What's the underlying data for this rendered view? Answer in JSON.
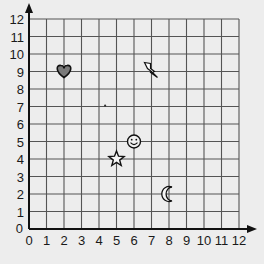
{
  "chart_data": {
    "type": "scatter",
    "title": "",
    "xlabel": "",
    "ylabel": "",
    "xlim": [
      0,
      12
    ],
    "ylim": [
      0,
      12
    ],
    "grid": true,
    "x_ticks": [
      "0",
      "1",
      "2",
      "3",
      "4",
      "5",
      "6",
      "7",
      "8",
      "9",
      "10",
      "11",
      "12"
    ],
    "y_ticks": [
      "0",
      "1",
      "2",
      "3",
      "4",
      "5",
      "6",
      "7",
      "8",
      "9",
      "10",
      "11",
      "12"
    ],
    "points": [
      {
        "name": "heart",
        "x": 2,
        "y": 9,
        "icon": "heart-icon"
      },
      {
        "name": "lightning",
        "x": 7,
        "y": 9,
        "icon": "lightning-icon"
      },
      {
        "name": "smiley",
        "x": 6,
        "y": 5,
        "icon": "smiley-icon"
      },
      {
        "name": "star",
        "x": 5,
        "y": 4,
        "icon": "star-icon"
      },
      {
        "name": "moon",
        "x": 8,
        "y": 2,
        "icon": "moon-icon"
      }
    ]
  },
  "colors": {
    "background": "#ededed",
    "grid": "#555555",
    "axis": "#111111",
    "heart_fill": "#7a7a7a"
  }
}
